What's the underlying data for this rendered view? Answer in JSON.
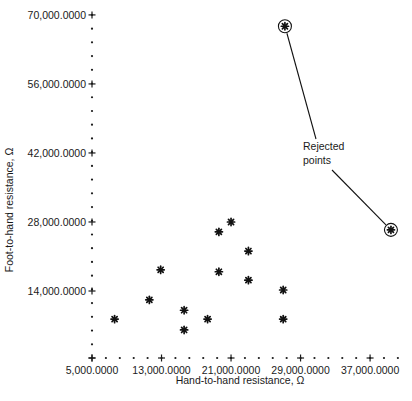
{
  "chart_data": {
    "type": "scatter",
    "title": "",
    "xlabel": "Hand-to-hand resistance, Ω",
    "ylabel": "Foot-to-hand resistance, Ω",
    "xlim": [
      5000000,
      40000000
    ],
    "ylim": [
      0,
      70000000
    ],
    "x_ticks": [
      5000000,
      13000000,
      21000000,
      29000000,
      37000000
    ],
    "x_tick_labels": [
      "5,000.0000",
      "13,000.0000",
      "21,000.0000",
      "29,000.0000",
      "37,000.0000"
    ],
    "y_ticks": [
      14000000,
      28000000,
      42000000,
      56000000,
      70000000
    ],
    "y_tick_labels": [
      "14,000.0000",
      "28,000.0000",
      "42,000.0000",
      "56,000.0000",
      "70,000.0000"
    ],
    "grid": false,
    "legend": null,
    "marker": "asterisk",
    "series": [
      {
        "name": "Accepted points",
        "points": [
          {
            "x": 7600000,
            "y": 8300000
          },
          {
            "x": 11600000,
            "y": 12200000
          },
          {
            "x": 12900000,
            "y": 18300000
          },
          {
            "x": 15600000,
            "y": 10100000
          },
          {
            "x": 15600000,
            "y": 6100000
          },
          {
            "x": 18300000,
            "y": 8300000
          },
          {
            "x": 19600000,
            "y": 17900000
          },
          {
            "x": 19600000,
            "y": 26000000
          },
          {
            "x": 21000000,
            "y": 28000000
          },
          {
            "x": 23000000,
            "y": 22100000
          },
          {
            "x": 23000000,
            "y": 16200000
          },
          {
            "x": 27000000,
            "y": 14200000
          },
          {
            "x": 27000000,
            "y": 8300000
          }
        ]
      },
      {
        "name": "Rejected points",
        "circled": true,
        "points": [
          {
            "x": 27200000,
            "y": 67700000
          },
          {
            "x": 39400000,
            "y": 26400000
          }
        ]
      }
    ],
    "annotations": [
      {
        "text_lines": [
          "Rejected",
          "points"
        ],
        "points_to": "Rejected points"
      }
    ]
  }
}
